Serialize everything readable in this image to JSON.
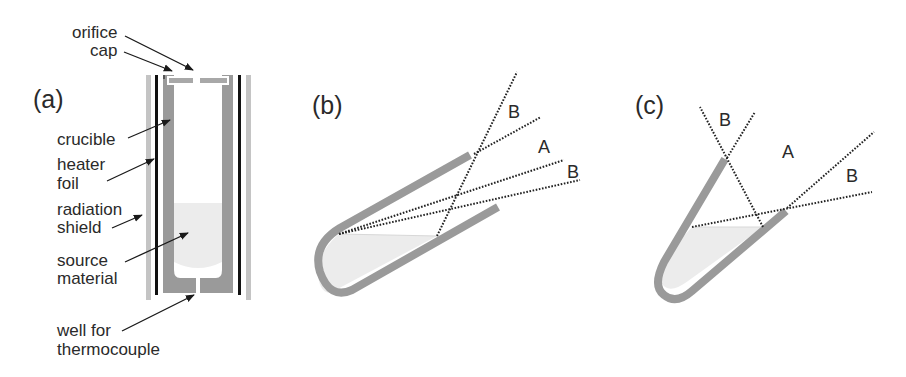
{
  "figure": {
    "panels": [
      {
        "id": "a",
        "label": "(a)"
      },
      {
        "id": "b",
        "label": "(b)"
      },
      {
        "id": "c",
        "label": "(c)"
      }
    ],
    "panel_a": {
      "labels": {
        "orifice": "orifice",
        "cap": "cap",
        "crucible": "crucible",
        "heater": "heater",
        "foil": "foil",
        "radiation": "radiation",
        "shield": "shield",
        "source": "source",
        "material": "material",
        "well_for": "well for",
        "thermocouple": "thermocouple"
      }
    },
    "panel_b": {
      "regions": {
        "b_upper": "B",
        "a": "A",
        "b_lower": "B"
      }
    },
    "panel_c": {
      "regions": {
        "b_upper": "B",
        "a": "A",
        "b_lower": "B"
      }
    },
    "colors": {
      "crucible": "#9a9a9a",
      "shield": "#c4c4c4",
      "foil": "#111111",
      "source": "#ececec",
      "dotted": "#222222",
      "text": "#2a2a2a"
    }
  }
}
